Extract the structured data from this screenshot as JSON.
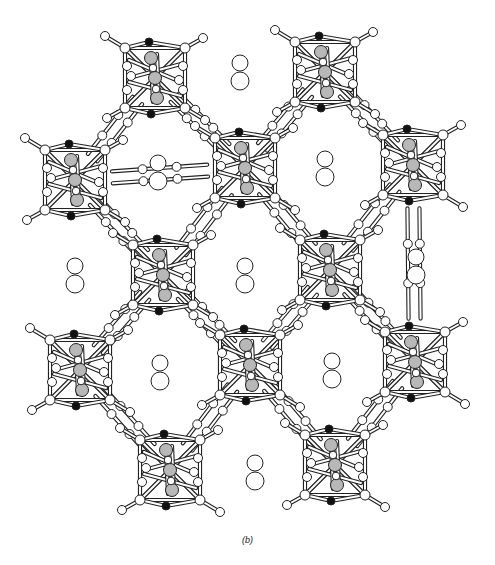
{
  "figure": {
    "caption": "(b)",
    "colors": {
      "bond": "#333333",
      "open_atom_fill": "#ffffff",
      "shaded_atom_fill": "#b8b8b8",
      "dark_atom_fill": "#111111",
      "stroke": "#222222"
    },
    "clusters": [
      {
        "id": "A",
        "cx": 155,
        "cy": 78
      },
      {
        "id": "B",
        "cx": 325,
        "cy": 72
      },
      {
        "id": "C",
        "cx": 75,
        "cy": 180
      },
      {
        "id": "D",
        "cx": 245,
        "cy": 168
      },
      {
        "id": "E",
        "cx": 413,
        "cy": 165
      },
      {
        "id": "F",
        "cx": 163,
        "cy": 275
      },
      {
        "id": "G",
        "cx": 330,
        "cy": 270
      },
      {
        "id": "H",
        "cx": 80,
        "cy": 370
      },
      {
        "id": "I",
        "cx": 250,
        "cy": 365
      },
      {
        "id": "J",
        "cx": 415,
        "cy": 362
      },
      {
        "id": "K",
        "cx": 170,
        "cy": 470
      },
      {
        "id": "L",
        "cx": 335,
        "cy": 465
      }
    ],
    "links": [
      [
        "A",
        "D"
      ],
      [
        "B",
        "D"
      ],
      [
        "C",
        "D"
      ],
      [
        "C",
        "F"
      ],
      [
        "D",
        "F"
      ],
      [
        "D",
        "G"
      ],
      [
        "E",
        "G"
      ],
      [
        "B",
        "E"
      ],
      [
        "F",
        "H"
      ],
      [
        "F",
        "I"
      ],
      [
        "G",
        "I"
      ],
      [
        "G",
        "J"
      ],
      [
        "H",
        "K"
      ],
      [
        "I",
        "K"
      ],
      [
        "I",
        "L"
      ],
      [
        "J",
        "L"
      ],
      [
        "A",
        "C"
      ],
      [
        "E",
        "J"
      ]
    ],
    "guest_pairs": [
      {
        "cx": 240,
        "cy": 72
      },
      {
        "cx": 158,
        "cy": 172
      },
      {
        "cx": 325,
        "cy": 168
      },
      {
        "cx": 75,
        "cy": 275
      },
      {
        "cx": 245,
        "cy": 275
      },
      {
        "cx": 416,
        "cy": 266
      },
      {
        "cx": 160,
        "cy": 372
      },
      {
        "cx": 332,
        "cy": 370
      },
      {
        "cx": 255,
        "cy": 472
      }
    ]
  }
}
